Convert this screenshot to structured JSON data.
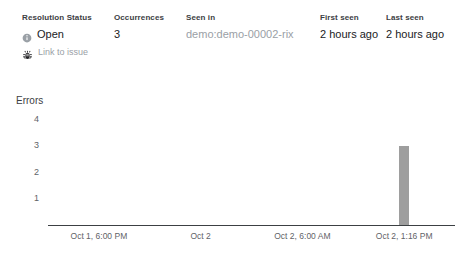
{
  "summary": {
    "columns": [
      {
        "id": "status",
        "header": "Resolution Status",
        "value": "Open",
        "icon": "info-circle-icon",
        "action_label": "Link to issue",
        "action_icon": "bug-icon"
      },
      {
        "id": "occurrences",
        "header": "Occurrences",
        "value": "3"
      },
      {
        "id": "seen_in",
        "header": "Seen in",
        "value": "demo:demo-00002-rix"
      },
      {
        "id": "first_seen",
        "header": "First seen",
        "value": "2 hours ago"
      },
      {
        "id": "last_seen",
        "header": "Last seen",
        "value": "2 hours ago"
      }
    ]
  },
  "chart_data": {
    "type": "bar",
    "title": "Errors",
    "xlabel": "",
    "ylabel": "",
    "grid": false,
    "legend": false,
    "categories": [
      "Oct 1, 6:00 PM",
      "Oct 2",
      "Oct 2, 6:00 AM",
      "Oct 2, 1:16 PM"
    ],
    "x_tick_labels": [
      "Oct 1, 6:00 PM",
      "Oct 2",
      "Oct 2, 6:00 AM",
      "Oct 2, 1:16 PM"
    ],
    "y_tick_labels": [
      "4",
      "3",
      "2",
      "1"
    ],
    "ylim": [
      0,
      4
    ],
    "bar_color": "#9e9e9e",
    "points": [
      {
        "x": "Oct 1, 6:00 PM",
        "y": 0
      },
      {
        "x": "Oct 2",
        "y": 0
      },
      {
        "x": "Oct 2, 6:00 AM",
        "y": 0
      },
      {
        "x": "Oct 2, 1:16 PM",
        "y": 3
      }
    ],
    "values": [
      0,
      0,
      0,
      3
    ]
  }
}
